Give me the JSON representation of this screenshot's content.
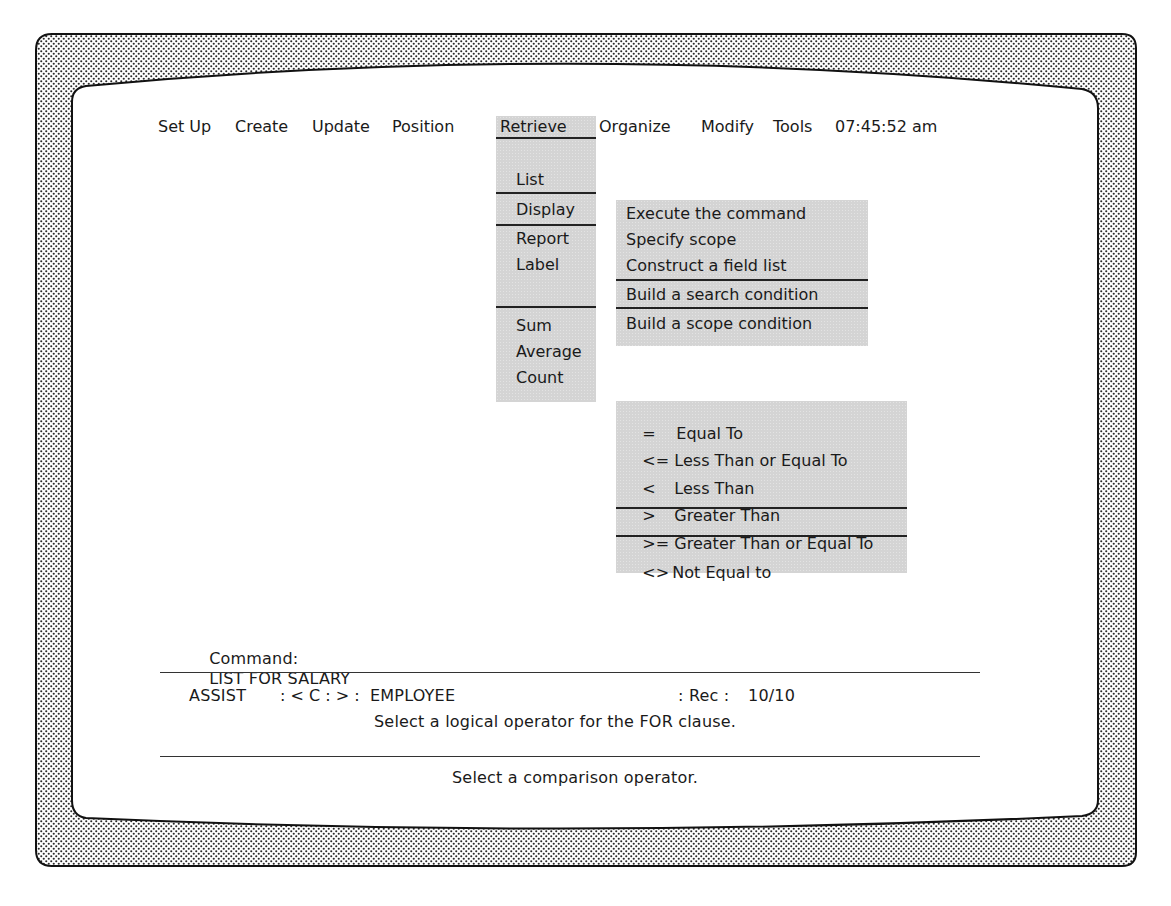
{
  "menubar": {
    "items": [
      {
        "label": "Set Up"
      },
      {
        "label": "Create"
      },
      {
        "label": "Update"
      },
      {
        "label": "Position"
      },
      {
        "label": "Retrieve",
        "active": true
      },
      {
        "label": "Organize"
      },
      {
        "label": "Modify"
      },
      {
        "label": "Tools"
      }
    ],
    "clock": "07:45:52 am"
  },
  "retrieve_menu": {
    "items": [
      {
        "label": "List",
        "selected": true
      },
      {
        "label": "Display"
      },
      {
        "label": "Report"
      },
      {
        "label": "Label"
      },
      {
        "label": "Sum"
      },
      {
        "label": "Average"
      },
      {
        "label": "Count"
      }
    ]
  },
  "list_submenu": {
    "items": [
      {
        "label": "Execute the command"
      },
      {
        "label": "Specify scope"
      },
      {
        "label": "Construct a field list"
      },
      {
        "label": "Build a search condition",
        "selected": true
      },
      {
        "label": "Build a scope condition"
      }
    ]
  },
  "operator_menu": {
    "items": [
      {
        "symbol": "=",
        "label": "Equal To"
      },
      {
        "symbol": "<=",
        "label": "Less Than or Equal To"
      },
      {
        "symbol": "<",
        "label": "Less Than"
      },
      {
        "symbol": ">",
        "label": "Greater Than"
      },
      {
        "symbol": ">=",
        "label": "Greater Than or Equal To",
        "selected": true
      },
      {
        "symbol": "<>",
        "label": "Not Equal to"
      }
    ]
  },
  "command_line": {
    "label": "Command:",
    "value": "LIST FOR SALARY"
  },
  "status_bar": {
    "mode": "ASSIST",
    "drive": ": < C : > :",
    "file": "EMPLOYEE",
    "rec_label": ": Rec :",
    "rec_value": "10/10",
    "hint": "Select a logical operator for the FOR clause."
  },
  "message_line": "Select a comparison operator.",
  "colors": {
    "menu_gray": "#d4d4d4",
    "text": "#1a1a1a",
    "bezel_dots": "#333333"
  }
}
